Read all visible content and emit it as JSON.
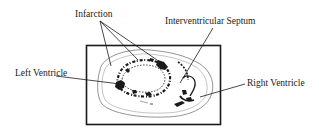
{
  "diagram": {
    "type": "annotated heart cross-section",
    "labels": {
      "infarction": "Infarction",
      "septum": "Interventricular Septum",
      "left_ventricle": "Left Ventricle",
      "right_ventricle": "Right Ventricle"
    },
    "colors": {
      "ink": "#1a1a1a",
      "outline": "#555555",
      "background": "#ffffff"
    }
  }
}
